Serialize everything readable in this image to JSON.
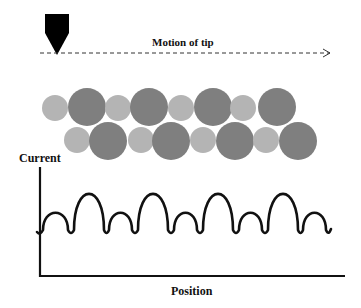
{
  "labels": {
    "motion": "Motion of tip",
    "ylabel": "Current",
    "xlabel": "Position"
  },
  "colors": {
    "background": "#ffffff",
    "tip": "#000000",
    "atom_light": "#b4b4b4",
    "atom_dark": "#7f7f7f",
    "curve": "#111111",
    "axis": "#111111"
  },
  "tip": {
    "x": 57,
    "top": 14,
    "width": 24,
    "point_y": 55
  },
  "motion_line": {
    "x1": 40,
    "x2": 330,
    "y": 53,
    "style": "dashed",
    "arrow": "open"
  },
  "atoms": {
    "top_row": [
      {
        "cx": 55,
        "cy": 108,
        "r": 13,
        "kind": "light"
      },
      {
        "cx": 87,
        "cy": 107,
        "r": 19,
        "kind": "dark"
      },
      {
        "cx": 118,
        "cy": 108,
        "r": 13,
        "kind": "light"
      },
      {
        "cx": 149,
        "cy": 107,
        "r": 19,
        "kind": "dark"
      },
      {
        "cx": 181,
        "cy": 108,
        "r": 13,
        "kind": "light"
      },
      {
        "cx": 213,
        "cy": 107,
        "r": 19,
        "kind": "dark"
      },
      {
        "cx": 243,
        "cy": 108,
        "r": 13,
        "kind": "light"
      },
      {
        "cx": 277,
        "cy": 107,
        "r": 19,
        "kind": "dark"
      }
    ],
    "bottom_row": [
      {
        "cx": 77,
        "cy": 140,
        "r": 13,
        "kind": "light"
      },
      {
        "cx": 108,
        "cy": 141,
        "r": 19,
        "kind": "dark"
      },
      {
        "cx": 141,
        "cy": 140,
        "r": 13,
        "kind": "light"
      },
      {
        "cx": 171,
        "cy": 141,
        "r": 19,
        "kind": "dark"
      },
      {
        "cx": 203,
        "cy": 140,
        "r": 13,
        "kind": "light"
      },
      {
        "cx": 235,
        "cy": 141,
        "r": 19,
        "kind": "dark"
      },
      {
        "cx": 266,
        "cy": 140,
        "r": 13,
        "kind": "light"
      },
      {
        "cx": 298,
        "cy": 141,
        "r": 19,
        "kind": "dark"
      }
    ]
  },
  "plot": {
    "axes": {
      "origin_x": 40,
      "origin_y": 276,
      "y_top": 167,
      "x_end": 345
    },
    "baseline_y": 232,
    "peaks": [
      {
        "x1": 43,
        "x2": 68,
        "top": 213,
        "size": "small"
      },
      {
        "x1": 74,
        "x2": 104,
        "top": 194,
        "size": "large"
      },
      {
        "x1": 109,
        "x2": 132,
        "top": 213,
        "size": "small"
      },
      {
        "x1": 138,
        "x2": 168,
        "top": 194,
        "size": "large"
      },
      {
        "x1": 174,
        "x2": 197,
        "top": 213,
        "size": "small"
      },
      {
        "x1": 203,
        "x2": 233,
        "top": 194,
        "size": "large"
      },
      {
        "x1": 239,
        "x2": 262,
        "top": 213,
        "size": "small"
      },
      {
        "x1": 268,
        "x2": 298,
        "top": 194,
        "size": "large"
      },
      {
        "x1": 303,
        "x2": 326,
        "top": 213,
        "size": "small"
      }
    ],
    "start_x": 37,
    "end_x": 331
  }
}
